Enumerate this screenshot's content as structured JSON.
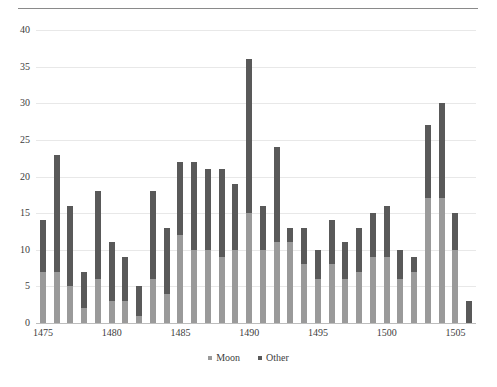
{
  "chart_data": {
    "type": "bar",
    "stacked": true,
    "title": "",
    "subtitle": "",
    "xlabel": "",
    "ylabel": "",
    "ylim": [
      0,
      40
    ],
    "ytick_step": 5,
    "yticks": [
      0,
      5,
      10,
      15,
      20,
      25,
      30,
      35,
      40
    ],
    "xticks": [
      1475,
      1480,
      1485,
      1490,
      1495,
      1500,
      1505
    ],
    "grid": true,
    "grid_axis": "y",
    "legend": [
      "Moon",
      "Other"
    ],
    "legend_position": "bottom-center",
    "colors": {
      "moon": "#9a9a9a",
      "other": "#595959",
      "grid": "#e8e8e8",
      "axis": "#bdbdbd",
      "text": "#3d3d3d",
      "rule": "#8a8a8a"
    },
    "categories": [
      1475,
      1476,
      1477,
      1478,
      1479,
      1480,
      1481,
      1482,
      1483,
      1484,
      1485,
      1486,
      1487,
      1488,
      1489,
      1490,
      1491,
      1492,
      1493,
      1494,
      1495,
      1496,
      1497,
      1498,
      1499,
      1500,
      1501,
      1502,
      1503,
      1504,
      1505,
      1506
    ],
    "series": [
      {
        "name": "Moon",
        "color": "#9a9a9a",
        "values": [
          7,
          7,
          5,
          2,
          6,
          3,
          3,
          1,
          6,
          4,
          12,
          10,
          10,
          9,
          10,
          15,
          10,
          11,
          11,
          8,
          6,
          8,
          6,
          7,
          9,
          9,
          6,
          7,
          17,
          17,
          10,
          0
        ]
      },
      {
        "name": "Other",
        "color": "#595959",
        "values": [
          7,
          16,
          11,
          5,
          12,
          8,
          6,
          4,
          12,
          9,
          10,
          12,
          11,
          12,
          9,
          21,
          6,
          13,
          2,
          5,
          4,
          6,
          5,
          6,
          6,
          7,
          4,
          2,
          10,
          13,
          5,
          3
        ]
      }
    ],
    "totals": [
      14,
      23,
      16,
      7,
      18,
      11,
      9,
      5,
      18,
      13,
      22,
      22,
      21,
      21,
      19,
      36,
      16,
      24,
      13,
      13,
      10,
      14,
      11,
      13,
      15,
      16,
      10,
      9,
      27,
      30,
      15,
      3
    ]
  }
}
